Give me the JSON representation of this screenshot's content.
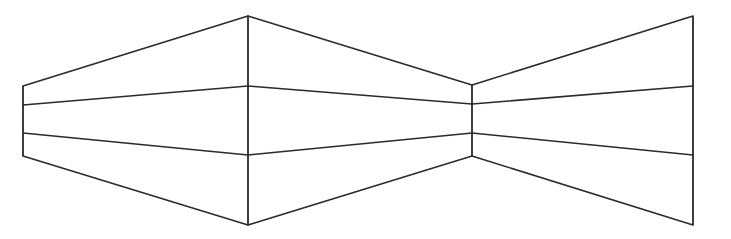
{
  "figure": {
    "type": "perspective-line-illusion",
    "stroke_color": "#2a2a2a",
    "background": "#ffffff",
    "left_wall": {
      "outer_edge": {
        "x": 23,
        "top": 86,
        "bottom": 156
      },
      "outer_inner_marks": [
        105,
        133
      ],
      "corner_edge": {
        "x": 248,
        "top": 16,
        "bottom": 225
      },
      "corner_inner_marks": [
        86,
        155
      ]
    },
    "right_wall": {
      "corner_edge": {
        "x": 472,
        "top": 85,
        "bottom": 156
      },
      "corner_inner_marks": [
        104,
        133
      ],
      "outer_edge": {
        "x": 693,
        "top": 16,
        "bottom": 225
      },
      "outer_inner_marks": [
        86,
        155
      ]
    }
  }
}
